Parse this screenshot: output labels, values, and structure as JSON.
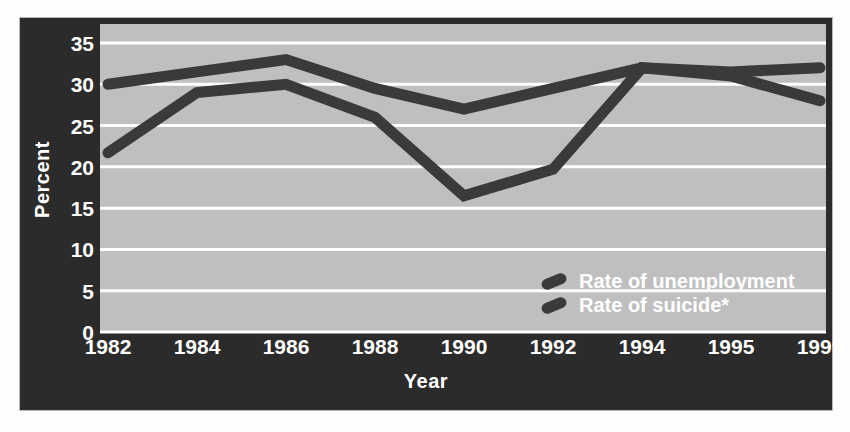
{
  "chart_data": {
    "type": "line",
    "title": "",
    "xlabel": "Year",
    "ylabel": "Percent",
    "categories": [
      "1982",
      "1984",
      "1986",
      "1988",
      "1990",
      "1992",
      "1994",
      "1995",
      "1999"
    ],
    "ylim": [
      0,
      35
    ],
    "yticks": [
      0,
      5,
      10,
      15,
      20,
      25,
      30,
      35
    ],
    "ytick_labels": [
      "0",
      "5",
      "10",
      "15",
      "20",
      "25",
      "30",
      "35"
    ],
    "grid": true,
    "legend_position": "inside-lower-right",
    "series": [
      {
        "name": "Rate of unemployment",
        "color": "#3a3a3a",
        "values": [
          30,
          31.5,
          33,
          29.5,
          27,
          29.5,
          32,
          31.5,
          32
        ]
      },
      {
        "name": "Rate of suicide*",
        "color": "#3a3a3a",
        "values": [
          21.7,
          29,
          30,
          26,
          16.5,
          19.7,
          32,
          31,
          28
        ]
      }
    ],
    "colors": {
      "panel_background": "#2b2b2b",
      "plot_background": "#bfbfbf",
      "gridline": "#ffffff",
      "line": "#3a3a3a",
      "text": "#ffffff"
    }
  },
  "legend": {
    "items": [
      {
        "label": "Rate of unemployment"
      },
      {
        "label": "Rate of suicide*"
      }
    ]
  }
}
